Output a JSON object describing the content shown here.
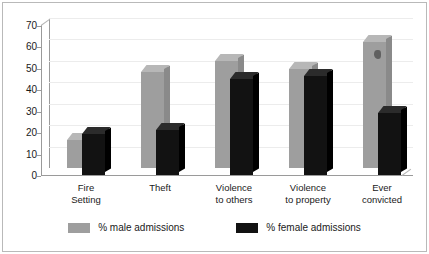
{
  "chart_data": {
    "type": "bar",
    "title": "",
    "subtitle": "",
    "xlabel": "",
    "ylabel": "",
    "ylim": [
      0,
      70
    ],
    "yticks": [
      0,
      10,
      20,
      30,
      40,
      50,
      60,
      70
    ],
    "grid": true,
    "legend_position": "bottom",
    "style": "3d-clustered-column",
    "categories": [
      "Fire Setting",
      "Theft",
      "Violence to others",
      "Violence to property",
      "Ever convicted"
    ],
    "category_lines": [
      [
        "Fire",
        "Setting"
      ],
      [
        "Theft",
        ""
      ],
      [
        "Violence",
        "to others"
      ],
      [
        "Violence",
        "to property"
      ],
      [
        "Ever",
        "convicted"
      ]
    ],
    "series": [
      {
        "name": "% male admissions",
        "color": "#9e9e9e",
        "values": [
          13,
          45,
          50,
          46,
          59
        ]
      },
      {
        "name": "% female admissions",
        "color": "#121212",
        "values": [
          19,
          21,
          45,
          46,
          29
        ]
      }
    ]
  },
  "legend": {
    "items": [
      {
        "label": "% male admissions",
        "swatch": "male"
      },
      {
        "label": "% female admissions",
        "swatch": "female"
      }
    ]
  },
  "axis": {
    "y_tick_labels": [
      "70",
      "60",
      "50",
      "40",
      "30",
      "20",
      "10",
      "0"
    ]
  }
}
